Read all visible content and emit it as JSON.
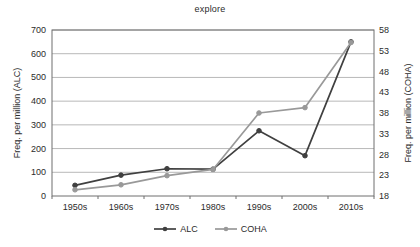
{
  "chart_data": {
    "type": "line",
    "title": "explore",
    "xlabel": "",
    "ylabel": "Freq. per million (ALC)",
    "y2label": "Freq. per million (COHA)",
    "categories": [
      "1950s",
      "1960s",
      "1970s",
      "1980s",
      "1990s",
      "2000s",
      "2010s"
    ],
    "series": [
      {
        "name": "ALC",
        "axis": "left",
        "color": "#404040",
        "values": [
          45,
          88,
          115,
          113,
          275,
          170,
          650
        ]
      },
      {
        "name": "COHA",
        "axis": "right",
        "color": "#999999",
        "values": [
          19.5,
          20.7,
          22.9,
          24.4,
          38.0,
          39.3,
          55.0
        ]
      }
    ],
    "ylim": [
      0,
      700
    ],
    "yticks": [
      0,
      100,
      200,
      300,
      400,
      500,
      600,
      700
    ],
    "y2lim": [
      18,
      58
    ],
    "y2ticks": [
      18,
      23,
      28,
      33,
      38,
      43,
      48,
      53,
      58
    ],
    "grid": true,
    "legend_position": "bottom"
  },
  "axes": {
    "left": {
      "title": "Freq. per million (ALC)",
      "ticks": [
        "0",
        "100",
        "200",
        "300",
        "400",
        "500",
        "600",
        "700"
      ]
    },
    "right": {
      "title": "Freq. per million (COHA)",
      "ticks": [
        "18",
        "23",
        "28",
        "33",
        "38",
        "43",
        "48",
        "53",
        "58"
      ]
    },
    "bottom": {
      "ticks": [
        "1950s",
        "1960s",
        "1970s",
        "1980s",
        "1990s",
        "2000s",
        "2010s"
      ]
    }
  },
  "legend": {
    "items": [
      {
        "label": "ALC",
        "color": "#404040"
      },
      {
        "label": "COHA",
        "color": "#999999"
      }
    ]
  },
  "colors": {
    "alc": "#404040",
    "coha": "#999999",
    "grid": "#b8b8b8",
    "frame": "#6e6e6e",
    "text": "#2b2b2b"
  }
}
